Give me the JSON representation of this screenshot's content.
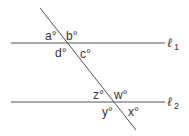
{
  "diagram": {
    "type": "parallel lines cut by a transversal",
    "lines": [
      {
        "id": "l1",
        "label": "ℓ",
        "subscript": "1"
      },
      {
        "id": "l2",
        "label": "ℓ",
        "subscript": "2"
      }
    ],
    "angles_top": {
      "a": "a°",
      "b": "b°",
      "c": "c°",
      "d": "d°"
    },
    "angles_bottom": {
      "z": "z°",
      "w": "w°",
      "x": "x°",
      "y": "y°"
    },
    "colors": {
      "stroke": "#555555",
      "text": "#333333"
    }
  }
}
